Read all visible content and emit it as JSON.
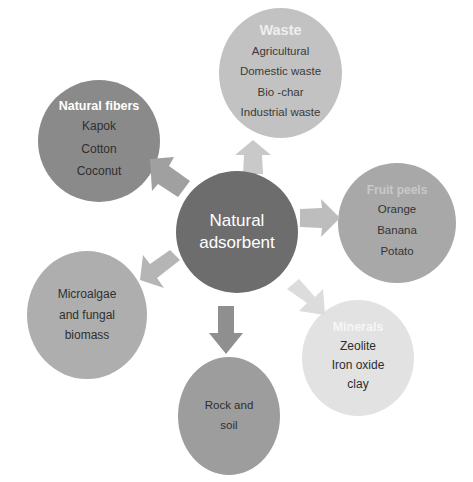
{
  "diagram": {
    "type": "hub-and-spoke",
    "center": {
      "id": "natural-adsorbent",
      "lines": [
        "Natural",
        "adsorbent"
      ],
      "color": "#6d6d6d"
    },
    "nodes": [
      {
        "id": "waste",
        "title": "Waste",
        "items": [
          "Agricultural",
          "Domestic waste",
          "Bio -char",
          "Industrial waste"
        ],
        "color": "#c2c2c2",
        "position": "top"
      },
      {
        "id": "natural-fibers",
        "title": "Natural fibers",
        "items": [
          "Kapok",
          "Cotton",
          "Coconut"
        ],
        "color": "#8a8a8a",
        "position": "upper-left"
      },
      {
        "id": "fruit-peels",
        "title": "Fruit peels",
        "items": [
          "Orange",
          "Banana",
          "Potato"
        ],
        "color": "#a8a8a8",
        "position": "right"
      },
      {
        "id": "minerals",
        "title": "Minerals",
        "items": [
          "Zeolite",
          "Iron oxide",
          "clay"
        ],
        "color": "#e2e2e2",
        "position": "lower-right"
      },
      {
        "id": "microalgae",
        "title": "",
        "items": [
          "Microalgae",
          "and fungal",
          "biomass"
        ],
        "color": "#aeaeae",
        "position": "lower-left"
      },
      {
        "id": "rock-and-soil",
        "title": "",
        "items": [
          "Rock and",
          "soil"
        ],
        "color": "#9d9d9d",
        "position": "bottom"
      }
    ],
    "arrows": [
      {
        "id": "arrow-up",
        "direction": "up",
        "target": "waste",
        "color": "#c9c9c9"
      },
      {
        "id": "arrow-upleft",
        "direction": "up-left",
        "target": "natural-fibers",
        "color": "#a0a0a0"
      },
      {
        "id": "arrow-right",
        "direction": "right",
        "target": "fruit-peels",
        "color": "#bdbdbd"
      },
      {
        "id": "arrow-downleft",
        "direction": "down-left",
        "target": "microalgae",
        "color": "#b5b5b5"
      },
      {
        "id": "arrow-downright",
        "direction": "down-right",
        "target": "minerals",
        "color": "#dcdcdc"
      },
      {
        "id": "arrow-down",
        "direction": "down",
        "target": "rock-and-soil",
        "color": "#8f8f8f"
      }
    ]
  }
}
